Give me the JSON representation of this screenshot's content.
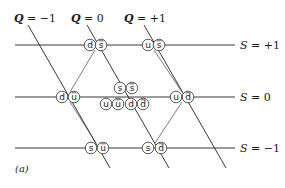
{
  "figure_label": "(a)",
  "q_lines": [
    {
      "label": "Q = −1",
      "var": "Q",
      "value": "−1",
      "x1": 28,
      "y1": 25,
      "x2": 110,
      "y2": 168
    },
    {
      "label": "Q = 0",
      "var": "Q",
      "value": "0",
      "x1": 87,
      "y1": 25,
      "x2": 169,
      "y2": 168
    },
    {
      "label": "Q = +1",
      "var": "Q",
      "value": "+1",
      "x1": 144,
      "y1": 25,
      "x2": 226,
      "y2": 168
    }
  ],
  "s_lines": [
    {
      "label": "S = +1",
      "var": "S",
      "value": "+1",
      "y": 45
    },
    {
      "label": "S = 0",
      "var": "S",
      "value": "0",
      "y": 97
    },
    {
      "label": "S = −1",
      "var": "S",
      "value": "−1",
      "y": 148
    }
  ],
  "quark_pairs": [
    {
      "quark": "d",
      "antiquark": "s",
      "qx": 90,
      "ax": 101,
      "y": 45
    },
    {
      "quark": "u",
      "antiquark": "s",
      "qx": 148,
      "ax": 159,
      "y": 45
    },
    {
      "quark": "d",
      "antiquark": "u",
      "qx": 62,
      "ax": 74,
      "y": 97
    },
    {
      "quark": "u",
      "antiquark": "d",
      "qx": 176,
      "ax": 188,
      "y": 97
    },
    {
      "quark": "s",
      "antiquark": "u",
      "qx": 91,
      "ax": 103,
      "y": 148
    },
    {
      "quark": "s",
      "antiquark": "d",
      "qx": 148,
      "ax": 161,
      "y": 148
    }
  ],
  "center_states": [
    {
      "text": "s",
      "bar": false,
      "x": 120,
      "y": 88
    },
    {
      "text": "s",
      "bar": true,
      "x": 132,
      "y": 88
    },
    {
      "text": "u",
      "bar": false,
      "x": 106,
      "y": 104
    },
    {
      "text": "u",
      "bar": true,
      "x": 118,
      "y": 104
    },
    {
      "text": "d",
      "bar": false,
      "x": 131,
      "y": 104
    },
    {
      "text": "d",
      "bar": true,
      "x": 143,
      "y": 104
    }
  ]
}
